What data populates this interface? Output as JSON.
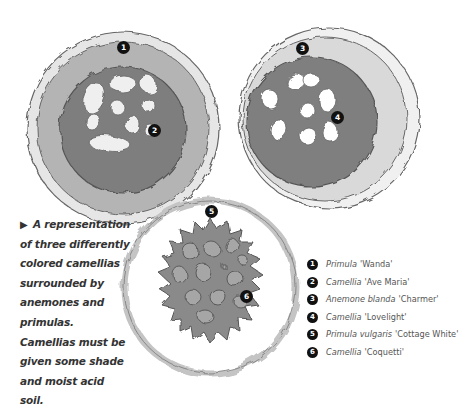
{
  "caption": {
    "arrow": "▶",
    "text": "A representation of three differently colored camellias surrounded by anemones and primulas. Camellias must be given some shade and moist acid soil."
  },
  "markers": [
    {
      "num": "1",
      "x": 117,
      "y": 41
    },
    {
      "num": "2",
      "x": 148,
      "y": 124
    },
    {
      "num": "3",
      "x": 296,
      "y": 42
    },
    {
      "num": "4",
      "x": 331,
      "y": 111
    },
    {
      "num": "5",
      "x": 205,
      "y": 205
    },
    {
      "num": "6",
      "x": 240,
      "y": 290
    }
  ],
  "legend": [
    {
      "num": "1",
      "italic": "Primula",
      "roman": "'Wanda'"
    },
    {
      "num": "2",
      "italic": "Camellia",
      "roman": "'Ave Maria'"
    },
    {
      "num": "3",
      "italic": "",
      "roman": "Anemone blanda 'Charmer'",
      "italic_full": "Anemone blanda",
      "roman_tail": "'Charmer'"
    },
    {
      "num": "4",
      "italic": "Camellia",
      "roman": "'Lovelight'"
    },
    {
      "num": "5",
      "italic": "Primula vulgaris",
      "roman": "'Cottage White'"
    },
    {
      "num": "6",
      "italic": "Camellia",
      "roman": "'Coquetti'"
    }
  ],
  "colors": {
    "outer_ring": "#d4d4d4",
    "mid_ring": "#a9a9a9",
    "camellia_fill": "#7d7d7d",
    "outline": "#555555",
    "petal": "#f4f4f4",
    "marker": "#111111"
  }
}
